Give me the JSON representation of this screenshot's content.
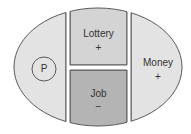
{
  "diagram": {
    "left": {
      "label": "P"
    },
    "top_middle": {
      "label": "Lottery",
      "sign": "+"
    },
    "bottom_middle": {
      "label": "Job",
      "sign": "−"
    },
    "right": {
      "label": "Money",
      "sign": "+"
    }
  },
  "colors": {
    "outer_fill": "#e3e3e3",
    "top_fill": "#d4d4d4",
    "bottom_fill": "#b4b4b4",
    "stroke": "#5a5a5a",
    "background": "#ffffff"
  }
}
